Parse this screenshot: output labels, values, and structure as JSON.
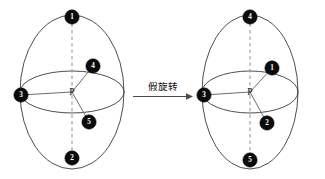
{
  "figure": {
    "background_color": "#ffffff",
    "node_fill_color": "#0b0b0b",
    "node_label_color": "#ffffff",
    "outline_color": "#3a3a3a",
    "axis_color": "#9a9a9a",
    "bond_color": "#6d6d6d",
    "arrow_color": "#4a4a4a"
  },
  "transition": {
    "caption": "假旋转",
    "arrow_icon": "right-arrow-icon",
    "direction": "left-to-right"
  },
  "structures": [
    {
      "id": "left-structure",
      "center_label": "P",
      "center_x": 72,
      "center_y": 92,
      "outline_rx": 52,
      "outline_ry": 77,
      "equator_rx": 52,
      "equator_ry": 21,
      "nodes": [
        {
          "label": "1",
          "x": 72,
          "y": 17,
          "r": 7.2,
          "position": "top"
        },
        {
          "label": "4",
          "x": 93,
          "y": 66,
          "r": 7.2,
          "position": "upper-right"
        },
        {
          "label": "3",
          "x": 21,
          "y": 95,
          "r": 7.2,
          "position": "left"
        },
        {
          "label": "5",
          "x": 89,
          "y": 122,
          "r": 7.2,
          "position": "lower-right"
        },
        {
          "label": "2",
          "x": 72,
          "y": 158,
          "r": 7.2,
          "position": "bottom"
        }
      ]
    },
    {
      "id": "right-structure",
      "center_label": "P",
      "center_x": 250,
      "center_y": 92,
      "outline_rx": 48,
      "outline_ry": 77,
      "equator_rx": 48,
      "equator_ry": 21,
      "nodes": [
        {
          "label": "4",
          "x": 250,
          "y": 17,
          "r": 7.2,
          "position": "top"
        },
        {
          "label": "1",
          "x": 272,
          "y": 68,
          "r": 7.2,
          "position": "upper-right"
        },
        {
          "label": "3",
          "x": 204,
          "y": 95,
          "r": 7.2,
          "position": "left"
        },
        {
          "label": "2",
          "x": 267,
          "y": 123,
          "r": 7.2,
          "position": "lower-right"
        },
        {
          "label": "5",
          "x": 250,
          "y": 160,
          "r": 7.2,
          "position": "bottom"
        }
      ]
    }
  ]
}
